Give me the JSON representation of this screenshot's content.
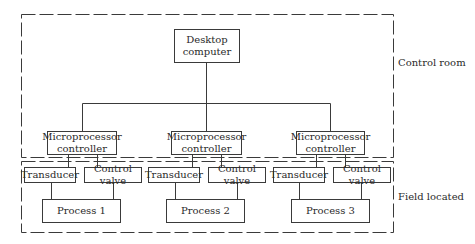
{
  "zones": {
    "control_room": "Control room",
    "field_located": "Field located"
  },
  "desktop": {
    "line1": "Desktop",
    "line2": "computer"
  },
  "controllers": [
    {
      "line1": "Microprocessor",
      "line2": "controller"
    },
    {
      "line1": "Microprocessor",
      "line2": "controller"
    },
    {
      "line1": "Microprocessor",
      "line2": "controller"
    }
  ],
  "units": [
    {
      "transducer": "Transducer",
      "valve": "Control valve",
      "process": "Process 1"
    },
    {
      "transducer": "Transducer",
      "valve": "Control valve",
      "process": "Process 2"
    },
    {
      "transducer": "Transducer",
      "valve": "Control valve",
      "process": "Process 3"
    }
  ]
}
